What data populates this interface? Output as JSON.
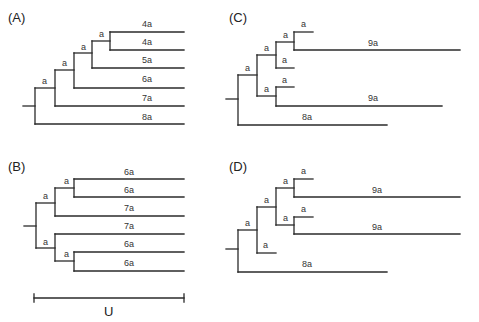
{
  "figure": {
    "panels": [
      {
        "id": "A",
        "label": "(A)",
        "leaves": [
          "4a",
          "4a",
          "5a",
          "6a",
          "7a",
          "8a"
        ],
        "node_labels": [
          "a",
          "a",
          "a",
          "a",
          "a"
        ]
      },
      {
        "id": "B",
        "label": "(B)",
        "leaves": [
          "6a",
          "6a",
          "7a",
          "7a",
          "6a",
          "6a"
        ],
        "node_labels": [
          "a",
          "a",
          "a",
          "a"
        ]
      },
      {
        "id": "C",
        "label": "(C)",
        "leaves": [
          "a",
          "9a",
          "a",
          "a",
          "9a",
          "8a"
        ],
        "node_labels": [
          "a",
          "a",
          "a",
          "a"
        ]
      },
      {
        "id": "D",
        "label": "(D)",
        "leaves": [
          "a",
          "9a",
          "a",
          "9a",
          "a",
          "8a"
        ],
        "node_labels": [
          "a",
          "a",
          "a",
          "a",
          "a"
        ]
      }
    ],
    "scale_bar": {
      "label": "U"
    }
  }
}
